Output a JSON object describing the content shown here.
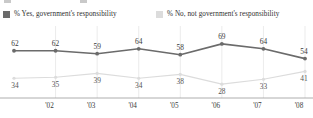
{
  "legend": {
    "entries": [
      {
        "label": "% Yes, government's responsibility",
        "color": "#6b6b6b",
        "swatch_name": "legend-swatch-yes"
      },
      {
        "label": "% No, not government's responsibility",
        "color": "#dcdcdc",
        "swatch_name": "legend-swatch-no"
      }
    ]
  },
  "axis": {
    "tick_labels": [
      "'02",
      "'03",
      "'04",
      "'05",
      "'06",
      "'07",
      "'08"
    ]
  },
  "chart_data": {
    "type": "line",
    "title": "",
    "subtitle": "",
    "xlabel": "",
    "ylabel": "",
    "ylim": [
      0,
      100
    ],
    "grid": "vertical",
    "legend_position": "top",
    "categories": [
      "'02",
      "'02",
      "'03",
      "'04",
      "'05",
      "'06",
      "'07",
      "'08"
    ],
    "x": [
      "'02",
      "'02",
      "'03",
      "'04",
      "'05",
      "'06",
      "'07",
      "'08"
    ],
    "tick_labels": [
      "'02",
      "'03",
      "'04",
      "'05",
      "'06",
      "'07",
      "'08"
    ],
    "series": [
      {
        "name": "% Yes, government's responsibility",
        "color": "#6b6b6b",
        "label_position": "above",
        "values": [
          62,
          62,
          59,
          64,
          58,
          69,
          64,
          54
        ]
      },
      {
        "name": "% No, not government's responsibility",
        "color": "#dcdcdc",
        "label_position": "below",
        "values": [
          34,
          35,
          39,
          34,
          38,
          28,
          33,
          41
        ]
      }
    ]
  }
}
